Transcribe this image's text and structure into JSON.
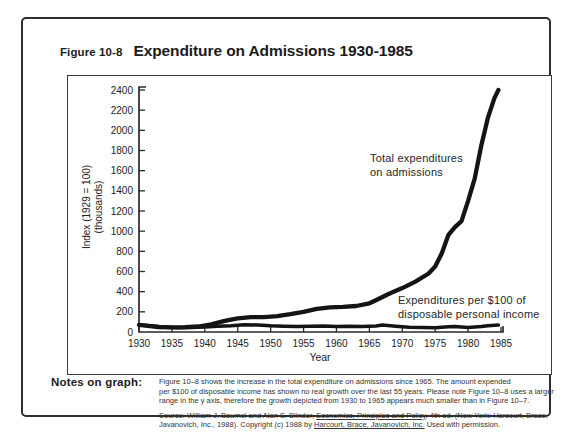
{
  "figure": {
    "label": "Figure 10-8",
    "title": "Expenditure on Admissions 1930-1985"
  },
  "annotations": {
    "total": [
      "Total expenditures",
      "on admissions"
    ],
    "ratio": [
      "Expenditures per $100 of",
      "disposable personal income"
    ]
  },
  "notes": {
    "label": "Notes on graph:",
    "lines": [
      "Figure 10–8 shows the increase in the total expenditure on admissions since 1965. The amount expended",
      "per $100 of disposable income has shown no real growth over the last 55 years. Please note Figure 10–8 uses a larger",
      "range in the y axis, therefore the growth depicted from 1930 to 1965 appears much smaller than in Figure 10–7."
    ],
    "source": {
      "l1a": "Source: William J. Baumol and Alan S. Blinder, ",
      "l1b": "Economics, Principles and Policy",
      "l1c": ", 4th ed. (New York: Harcourt, Brace,",
      "l2a": "Javanovich, Inc., 1988). Copyright (c) 1988 by ",
      "l2b": "Harcourt, Brace, Javanovich, Inc.",
      "l2c": " Used with permission."
    }
  },
  "colors": {
    "ink": "#1b1b1b",
    "axis": "#2a2a2a",
    "line": "#141414"
  },
  "chart_data": {
    "type": "line",
    "title": "Expenditure on Admissions 1930-1985",
    "xlabel": "Year",
    "ylabel": "Index (1929 = 100) (thousands)",
    "ylabel_lines": [
      "Index (1929 = 100)",
      "(thousands)"
    ],
    "xlim": [
      1930,
      1985
    ],
    "ylim": [
      0,
      2400
    ],
    "x_ticks": [
      1930,
      1935,
      1940,
      1945,
      1950,
      1955,
      1960,
      1965,
      1970,
      1975,
      1980,
      1985
    ],
    "y_ticks": [
      0,
      200,
      400,
      600,
      800,
      1000,
      1200,
      1400,
      1600,
      1800,
      2000,
      2200,
      2400
    ],
    "grid": false,
    "legend_position": "annotations-inside-plot",
    "series": [
      {
        "name": "Total expenditures on admissions",
        "x": [
          1930,
          1931,
          1933,
          1935,
          1937,
          1939,
          1941,
          1943,
          1945,
          1947,
          1949,
          1951,
          1953,
          1955,
          1957,
          1959,
          1961,
          1963,
          1965,
          1966,
          1968,
          1970,
          1972,
          1974,
          1975,
          1976,
          1977,
          1978,
          1979,
          1980,
          1981,
          1982,
          1983,
          1984,
          1984.6
        ],
        "y": [
          70,
          62,
          50,
          46,
          48,
          55,
          75,
          110,
          135,
          148,
          148,
          158,
          178,
          200,
          230,
          245,
          250,
          258,
          285,
          315,
          380,
          435,
          500,
          580,
          650,
          780,
          960,
          1040,
          1100,
          1300,
          1520,
          1850,
          2120,
          2320,
          2400
        ]
      },
      {
        "name": "Expenditures per $100 of disposable personal income",
        "x": [
          1930,
          1932,
          1934,
          1936,
          1938,
          1940,
          1942,
          1944,
          1946,
          1948,
          1950,
          1952,
          1954,
          1956,
          1958,
          1960,
          1962,
          1964,
          1966,
          1967,
          1969,
          1971,
          1973,
          1975,
          1977,
          1978,
          1980,
          1982,
          1983,
          1984.6
        ],
        "y": [
          72,
          60,
          48,
          42,
          45,
          50,
          58,
          62,
          72,
          70,
          62,
          58,
          55,
          58,
          60,
          55,
          58,
          55,
          60,
          68,
          58,
          48,
          45,
          42,
          52,
          55,
          45,
          55,
          62,
          68
        ]
      }
    ]
  }
}
